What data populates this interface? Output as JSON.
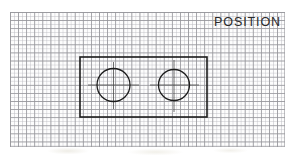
{
  "drawing": {
    "title": "POSITION",
    "sheet": {
      "type": "graph-paper",
      "x": 10,
      "y": 12,
      "width": 275,
      "height": 135,
      "minor_grid_px": 4.05,
      "major_grid_px": 8.1,
      "grid_color": "#96969b",
      "minor_grid_color": "#bebec4",
      "background_color": "#fdfdfd"
    },
    "line_color": "#1c1c1c",
    "plate": {
      "label": "rectangular-plate",
      "x": 80,
      "y": 57,
      "width": 127,
      "height": 60,
      "stroke_width": 1.6
    },
    "holes": [
      {
        "label": "left-hole",
        "cx": 113.5,
        "cy": 85,
        "r": 16.5,
        "stroke_width": 1.3
      },
      {
        "label": "right-hole",
        "cx": 174,
        "cy": 85,
        "r": 15.5,
        "stroke_width": 1.3
      }
    ],
    "centerlines": {
      "label": "hole-centerlines",
      "color": "#4a4a4a",
      "stroke_width": 0.8,
      "horizontal": [
        {
          "x1": 88,
          "x2": 139,
          "y": 85
        },
        {
          "x1": 150,
          "x2": 199,
          "y": 85
        }
      ],
      "vertical": [
        {
          "x": 113.5,
          "y1": 62,
          "y2": 109
        },
        {
          "x": 174,
          "y1": 60,
          "y2": 112
        }
      ]
    }
  }
}
